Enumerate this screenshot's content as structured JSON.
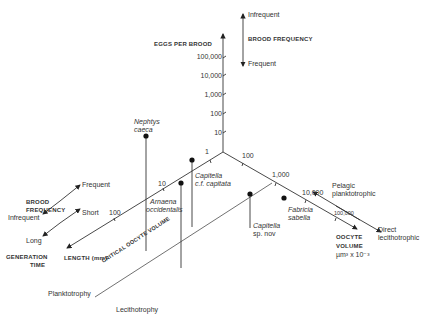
{
  "vertical_axis": {
    "title": "EGGS PER BROOD",
    "ticks": [
      "100,000",
      "10,000",
      "1,000",
      "100",
      "10"
    ]
  },
  "brood_frequency_top": {
    "title": "BROOD FREQUENCY",
    "top": "Infrequent",
    "bottom": "Frequent"
  },
  "length_axis": {
    "title": "LENGTH (mm)",
    "ticks": [
      "1",
      "10",
      "100"
    ]
  },
  "oocyte_axis": {
    "title_line1": "OOCYTE",
    "title_line2": "VOLUME",
    "title_line3": "µm³ x 10⁻³",
    "ticks": [
      "100",
      "1,000",
      "10,000",
      "100,000"
    ]
  },
  "brood_frequency_left": {
    "title_line1": "BROOD",
    "title_line2": "FREQUENCY",
    "high": "Frequent",
    "low": "Infrequent"
  },
  "generation_time": {
    "title_line1": "GENERATION",
    "title_line2": "TIME",
    "high": "Short",
    "low": "Long"
  },
  "development": {
    "high": "Pelagic planktotrophic",
    "high_line1": "Pelagic",
    "high_line2": "planktotrophic",
    "low_line1": "Direct",
    "low_line2": "lecithotrophic"
  },
  "critical_line": {
    "label": "CRITICAL OOCYTE VOLUME",
    "side_a": "Planktotrophy",
    "side_b": "Lecithotrophy"
  },
  "species": [
    {
      "line1": "Nephtys",
      "line2": "caeca"
    },
    {
      "line1": "Capitella",
      "line2": "c.f. capitata"
    },
    {
      "line1": "Arnaena",
      "line2": "occidentalis"
    },
    {
      "line1": "Capitella",
      "line2": "sp. nov"
    },
    {
      "line1": "Fabricia",
      "line2": "sabella"
    }
  ]
}
